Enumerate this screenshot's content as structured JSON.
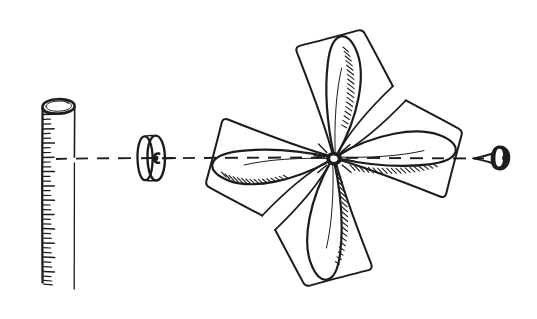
{
  "canvas": {
    "width": 537,
    "height": 319,
    "background_color": "#ffffff",
    "ink_color": "#1c1c1c",
    "style": "hand-drawn pen and ink line sketch"
  },
  "illustration": {
    "title": "Pinwheel assembly exploded along a dashed axis",
    "subject": "four-bladed paper pinwheel mounted on a pin with a bead spacer and a graduated post",
    "axis": {
      "name": "assembly-axis",
      "orientation": "horizontal",
      "y": 158,
      "x_start": 56,
      "x_end": 487,
      "line_style": "dashed",
      "dash_length": 11,
      "dash_gap": 9,
      "stroke_width": 1.9
    },
    "parts": [
      {
        "id": "post",
        "label": "graduated post",
        "icon": "cylinder-post-icon",
        "position_x": 57,
        "top_y": 103,
        "bottom_y": 289,
        "width": 31,
        "tick_count": 38,
        "tick_side": "left",
        "open_top": true
      },
      {
        "id": "bead",
        "label": "bead spacer",
        "icon": "disc-bead-icon",
        "center_x": 146,
        "center_y": 158,
        "outer_radius_y": 23,
        "outer_radius_x": 10,
        "hole": true
      },
      {
        "id": "pinwheel",
        "label": "four-blade pinwheel",
        "icon": "pinwheel-icon",
        "hub_x": 334,
        "hub_y": 158,
        "blade_count": 4,
        "blade_angles_deg": [
          0,
          90,
          180,
          270
        ],
        "blades": [
          {
            "id": "blade-right",
            "angle_deg": 0,
            "tip_x": 464,
            "tip_y": 158,
            "shading": "hatched-lower-edge"
          },
          {
            "id": "blade-top",
            "angle_deg": 90,
            "tip_x": 334,
            "tip_y": 28,
            "shading": "hatched-right-edge"
          },
          {
            "id": "blade-left",
            "angle_deg": 180,
            "tip_x": 204,
            "tip_y": 158,
            "shading": "hatched-lower-edge"
          },
          {
            "id": "blade-bottom",
            "angle_deg": 270,
            "tip_x": 334,
            "tip_y": 288,
            "shading": "hatched-right-edge"
          }
        ]
      },
      {
        "id": "pin",
        "label": "pin with flared head",
        "icon": "push-pin-icon",
        "shaft_start_x": 474,
        "head_x": 505,
        "center_y": 158,
        "head_height": 26,
        "filled": true
      }
    ]
  }
}
